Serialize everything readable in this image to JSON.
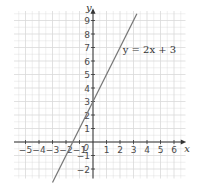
{
  "chart_data": {
    "type": "line",
    "title": "",
    "xlabel": "x",
    "ylabel": "y",
    "xlim": [
      -6,
      7
    ],
    "ylim": [
      -3,
      10
    ],
    "x_ticks": [
      -5,
      -4,
      -3,
      -2,
      -1,
      1,
      2,
      3,
      4,
      5,
      6
    ],
    "y_ticks": [
      -2,
      -1,
      1,
      2,
      3,
      4,
      5,
      6,
      7,
      8,
      9
    ],
    "origin_label": "0",
    "grid": true,
    "series": [
      {
        "name": "y = 2x + 3",
        "equation": "y = 2x + 3",
        "slope": 2,
        "intercept": 3,
        "x": [
          -3,
          3.25
        ],
        "y": [
          -3,
          9.5
        ]
      }
    ],
    "annotations": [
      {
        "text": "y = 2x + 3",
        "x": 2.2,
        "y": 6.6
      }
    ],
    "colors": {
      "line": "#777777",
      "axis": "#333333",
      "grid": "#d9d9d9"
    }
  }
}
